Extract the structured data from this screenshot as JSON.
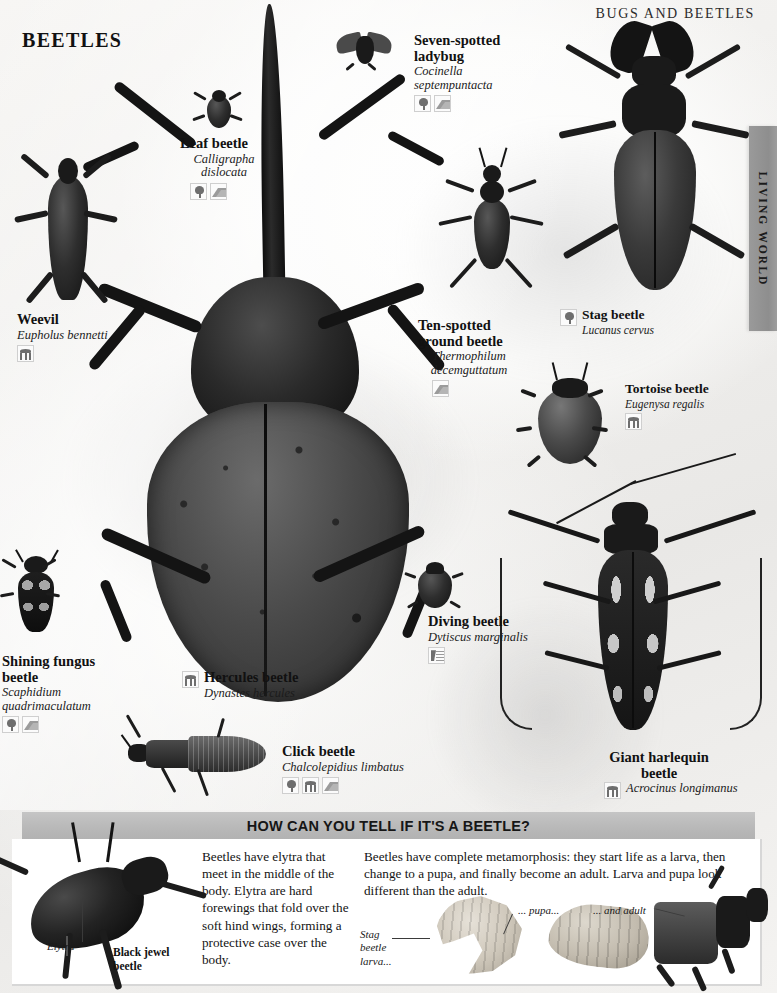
{
  "header": {
    "kicker": "BUGS AND BEETLES",
    "title": "BEETLES",
    "side_tab": "LIVING WORLD"
  },
  "specimens": [
    {
      "id": "weevil",
      "common": "Weevil",
      "latin": "Eupholus bennetti",
      "icons": [
        "canopy"
      ]
    },
    {
      "id": "leaf-beetle",
      "common": "Leaf beetle",
      "latin": "Calligrapha dislocata",
      "icons": [
        "tree",
        "mountain"
      ]
    },
    {
      "id": "seven-spotted-ladybug",
      "common": "Seven-spotted ladybug",
      "latin": "Cocinella septempuntacta",
      "icons": [
        "tree",
        "mountain"
      ]
    },
    {
      "id": "ten-spotted-ground-beetle",
      "common": "Ten-spotted ground beetle",
      "latin": "Thermophilum decemguttatum",
      "icons": [
        "mountain"
      ]
    },
    {
      "id": "stag-beetle",
      "common": "Stag beetle",
      "latin": "Lucanus cervus",
      "icons": [
        "tree"
      ]
    },
    {
      "id": "tortoise-beetle",
      "common": "Tortoise beetle",
      "latin": "Eugenysa regalis",
      "icons": [
        "canopy"
      ]
    },
    {
      "id": "hercules-beetle",
      "common": "Hercules beetle",
      "latin": "Dynastes hercules",
      "icons": [
        "canopy"
      ]
    },
    {
      "id": "shining-fungus-beetle",
      "common": "Shining fungus beetle",
      "latin": "Scaphidium quadrimaculatum",
      "icons": [
        "tree",
        "mountain"
      ]
    },
    {
      "id": "click-beetle",
      "common": "Click beetle",
      "latin": "Chalcolepidius limbatus",
      "icons": [
        "tree",
        "canopy",
        "mountain"
      ]
    },
    {
      "id": "diving-beetle",
      "common": "Diving beetle",
      "latin": "Dytiscus marginalis",
      "icons": [
        "water"
      ]
    },
    {
      "id": "giant-harlequin-beetle",
      "common": "Giant harlequin beetle",
      "latin": "Acrocinus longimanus",
      "icons": [
        "canopy"
      ]
    }
  ],
  "feature": {
    "heading": "HOW CAN YOU TELL IF IT'S A BEETLE?",
    "column_left": "Beetles have elytra that meet in the middle of the body. Elytra are hard forewings that fold over the soft hind wings, forming a protective case over the body.",
    "column_right": "Beetles have complete metamorphosis: they start life as a larva, then change to a pupa, and finally become an adult. Larva and pupa look different than the adult.",
    "callouts": {
      "elytra": "Elytra",
      "black_jewel_beetle": "Black jewel beetle",
      "stag_beetle_larva": "Stag beetle larva...",
      "pupa": "... pupa...",
      "adult": "... and adult"
    }
  },
  "colors": {
    "page_bg": "#f3f2f0",
    "panel_bar": "#bcbcbc",
    "side_tab": "#949494",
    "text": "#111111"
  }
}
